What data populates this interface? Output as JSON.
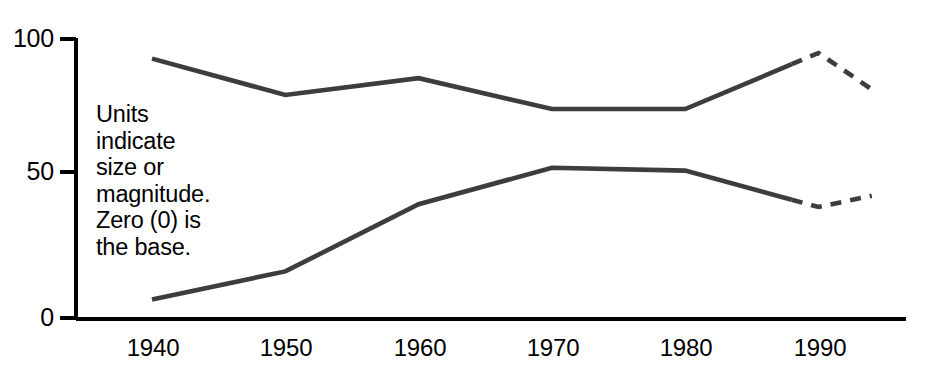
{
  "chart_data": {
    "type": "line",
    "title": "",
    "subtitle": "",
    "xlabel": "",
    "ylabel": "",
    "x": [
      1940,
      1950,
      1960,
      1970,
      1980,
      1990,
      1994
    ],
    "categories": [
      "1940",
      "1950",
      "1960",
      "1970",
      "1980",
      "1990",
      ""
    ],
    "xtick_labels": [
      "1940",
      "1950",
      "1960",
      "1970",
      "1980",
      "1990"
    ],
    "ytick_labels": [
      "0",
      "50",
      "100"
    ],
    "ylim": [
      0,
      100
    ],
    "xlim": [
      1940,
      1994
    ],
    "grid": false,
    "legend": "none",
    "series": [
      {
        "name": "upper-series",
        "values": [
          93,
          80,
          86,
          75,
          75,
          95,
          82
        ],
        "style": "solid-then-dashed",
        "solid_through": 1988,
        "color": "#3d3d3d"
      },
      {
        "name": "lower-series",
        "values": [
          7,
          17,
          41,
          54,
          53,
          40,
          44
        ],
        "style": "solid-then-dashed",
        "solid_through": 1988,
        "color": "#3d3d3d"
      }
    ],
    "annotations": [
      {
        "name": "units-note",
        "lines": [
          "Units",
          "indicate",
          "size or",
          "magnitude.",
          "Zero (0) is",
          "the base."
        ]
      }
    ],
    "colors": {
      "axis": "#000000",
      "series": "#3d3d3d",
      "background": "#ffffff",
      "text": "#000000"
    }
  },
  "axis": {
    "y_ticks": [
      {
        "label": "100",
        "value": 100
      },
      {
        "label": "50",
        "value": 50
      },
      {
        "label": "0",
        "value": 0
      }
    ],
    "x_ticks": [
      {
        "label": "1940",
        "value": 1940
      },
      {
        "label": "1950",
        "value": 1950
      },
      {
        "label": "1960",
        "value": 1960
      },
      {
        "label": "1970",
        "value": 1970
      },
      {
        "label": "1980",
        "value": 1980
      },
      {
        "label": "1990",
        "value": 1990
      }
    ]
  },
  "annotation": {
    "line1": "Units",
    "line2": "indicate",
    "line3": "size or",
    "line4": "magnitude.",
    "line5": "Zero (0) is",
    "line6": "the base."
  }
}
